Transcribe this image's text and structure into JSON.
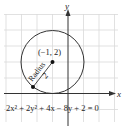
{
  "diagram": {
    "type": "circle-on-coordinate-grid",
    "axes": {
      "x_label": "x",
      "y_label": "y"
    },
    "center": {
      "x": -1,
      "y": 2,
      "label": "(−1, 2)"
    },
    "radius": {
      "value": 2,
      "label_text": "Radius",
      "value_label": "2"
    },
    "equation": "2x² + 2y² + 4x − 8y + 2 = 0",
    "grid": {
      "x_range": [
        -4,
        3
      ],
      "y_range": [
        -1,
        5
      ],
      "spacing_px": 15.5
    },
    "colors": {
      "grid": "#d9d9d9",
      "axis": "#333333",
      "circle": "#333333",
      "point": "#111111"
    }
  }
}
